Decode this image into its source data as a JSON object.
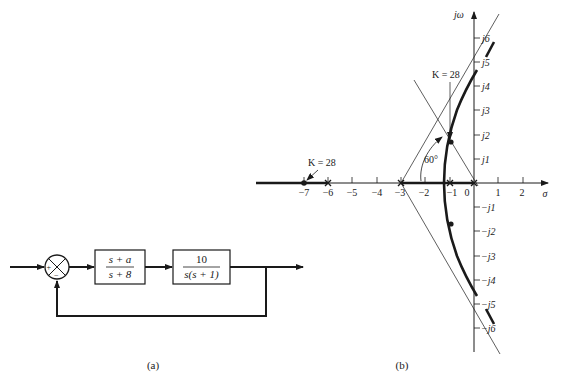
{
  "figure": {
    "panel_a": {
      "caption": "(a)",
      "summing_junction": {
        "plus_sign": "+",
        "minus_sign": "−"
      },
      "blocks": [
        {
          "numerator": "s + a",
          "denominator": "s + 8"
        },
        {
          "numerator": "10",
          "denominator": "s(s + 1)"
        }
      ]
    },
    "panel_b": {
      "caption": "(b)",
      "axes": {
        "real_label": "σ",
        "imag_label": "jω",
        "real_ticks": [
          "−7",
          "−6",
          "−5",
          "−4",
          "−3",
          "−2",
          "−1",
          "0",
          "1",
          "2"
        ],
        "imag_ticks_pos": [
          "j1",
          "j2",
          "j3",
          "j4",
          "j5",
          "j6"
        ],
        "imag_ticks_neg": [
          "−j1",
          "−j2",
          "−j3",
          "−j4",
          "−j5",
          "−j6"
        ]
      },
      "annotations": {
        "gain_real": "K = 28",
        "gain_complex": "K = 28",
        "angle": "60°"
      },
      "colors": {
        "ink": "#1a1a1a",
        "background": "#ffffff"
      }
    }
  }
}
